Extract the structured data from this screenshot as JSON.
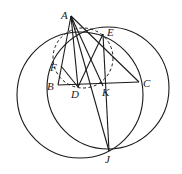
{
  "diagram": {
    "type": "geometry-figure",
    "points": {
      "A": {
        "label": "A",
        "x": 71,
        "y": 16,
        "lx": 61,
        "ly": 19
      },
      "E": {
        "label": "E",
        "x": 103,
        "y": 34,
        "lx": 107,
        "ly": 36
      },
      "F": {
        "label": "F",
        "x": 61,
        "y": 66,
        "lx": 50,
        "ly": 71
      },
      "B": {
        "label": "B",
        "x": 58,
        "y": 85,
        "lx": 47,
        "ly": 90
      },
      "D": {
        "label": "D",
        "x": 78,
        "y": 87,
        "lx": 71,
        "ly": 98
      },
      "K": {
        "label": "K",
        "x": 103,
        "y": 86,
        "lx": 102,
        "ly": 96
      },
      "C": {
        "label": "C",
        "x": 139,
        "y": 82,
        "lx": 143,
        "ly": 87
      },
      "J": {
        "label": "J",
        "x": 109,
        "y": 151,
        "lx": 105,
        "ly": 163
      }
    },
    "circles": [
      {
        "name": "left-circle",
        "cx": 80,
        "cy": 95,
        "r": 63,
        "style": "solid"
      },
      {
        "name": "right-circle",
        "cx": 108,
        "cy": 88,
        "r": 61,
        "style": "solid"
      },
      {
        "name": "dashed-circle",
        "cx": 83,
        "cy": 58,
        "r": 30,
        "style": "dashed"
      }
    ],
    "segments": [
      [
        "A",
        "B"
      ],
      [
        "A",
        "C"
      ],
      [
        "B",
        "C"
      ],
      [
        "A",
        "D"
      ],
      [
        "D",
        "E"
      ],
      [
        "D",
        "F"
      ],
      [
        "A",
        "J"
      ],
      [
        "E",
        "J"
      ],
      [
        "A",
        "K"
      ]
    ]
  }
}
